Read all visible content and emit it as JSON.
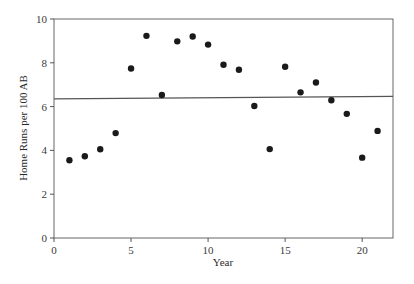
{
  "chart_data": {
    "type": "scatter",
    "title": "",
    "xlabel": "Year",
    "ylabel": "Home Runs per 100 AB",
    "xlim": [
      0,
      22
    ],
    "ylim": [
      0,
      10
    ],
    "xticks": [
      0,
      5,
      10,
      15,
      20
    ],
    "yticks": [
      0,
      2,
      4,
      6,
      8,
      10
    ],
    "grid": false,
    "legend": null,
    "series": [
      {
        "name": "Home runs per 100 AB",
        "kind": "scatter",
        "x": [
          1,
          2,
          3,
          4,
          5,
          6,
          7,
          8,
          9,
          10,
          11,
          12,
          13,
          14,
          15,
          16,
          17,
          18,
          19,
          20,
          21
        ],
        "y": [
          3.55,
          3.73,
          4.05,
          4.79,
          7.74,
          9.23,
          6.53,
          8.98,
          9.2,
          8.83,
          7.91,
          7.68,
          6.03,
          4.06,
          7.82,
          6.65,
          7.1,
          6.29,
          5.67,
          3.67,
          4.89
        ]
      },
      {
        "name": "Fitted line",
        "kind": "line",
        "x": [
          0,
          22
        ],
        "y": [
          6.35,
          6.47
        ]
      }
    ],
    "colors": {
      "points": "#1a1a1a",
      "line": "#555555",
      "axes": "#555555"
    }
  }
}
